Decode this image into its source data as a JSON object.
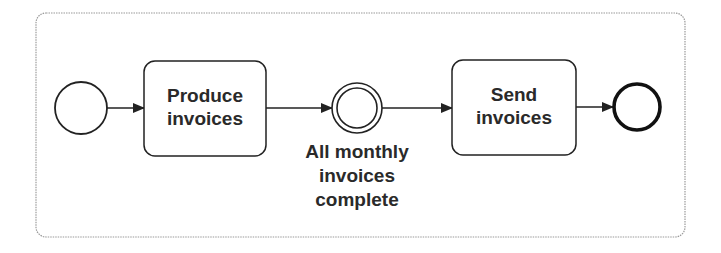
{
  "diagram": {
    "type": "BPMN process",
    "nodes": [
      {
        "id": "start",
        "kind": "start-event",
        "label": ""
      },
      {
        "id": "task1",
        "kind": "task",
        "label_lines": [
          "Produce",
          "invoices"
        ]
      },
      {
        "id": "intermediate",
        "kind": "intermediate-event",
        "label_lines": [
          "All monthly",
          "invoices",
          "complete"
        ]
      },
      {
        "id": "task2",
        "kind": "task",
        "label_lines": [
          "Send",
          "invoices"
        ]
      },
      {
        "id": "end",
        "kind": "end-event",
        "label": ""
      }
    ],
    "edges": [
      {
        "from": "start",
        "to": "task1"
      },
      {
        "from": "task1",
        "to": "intermediate"
      },
      {
        "from": "intermediate",
        "to": "task2"
      },
      {
        "from": "task2",
        "to": "end"
      }
    ],
    "colors": {
      "stroke": "#222222",
      "frame": "#9a9a9a",
      "text": "#2a2a2a"
    }
  }
}
